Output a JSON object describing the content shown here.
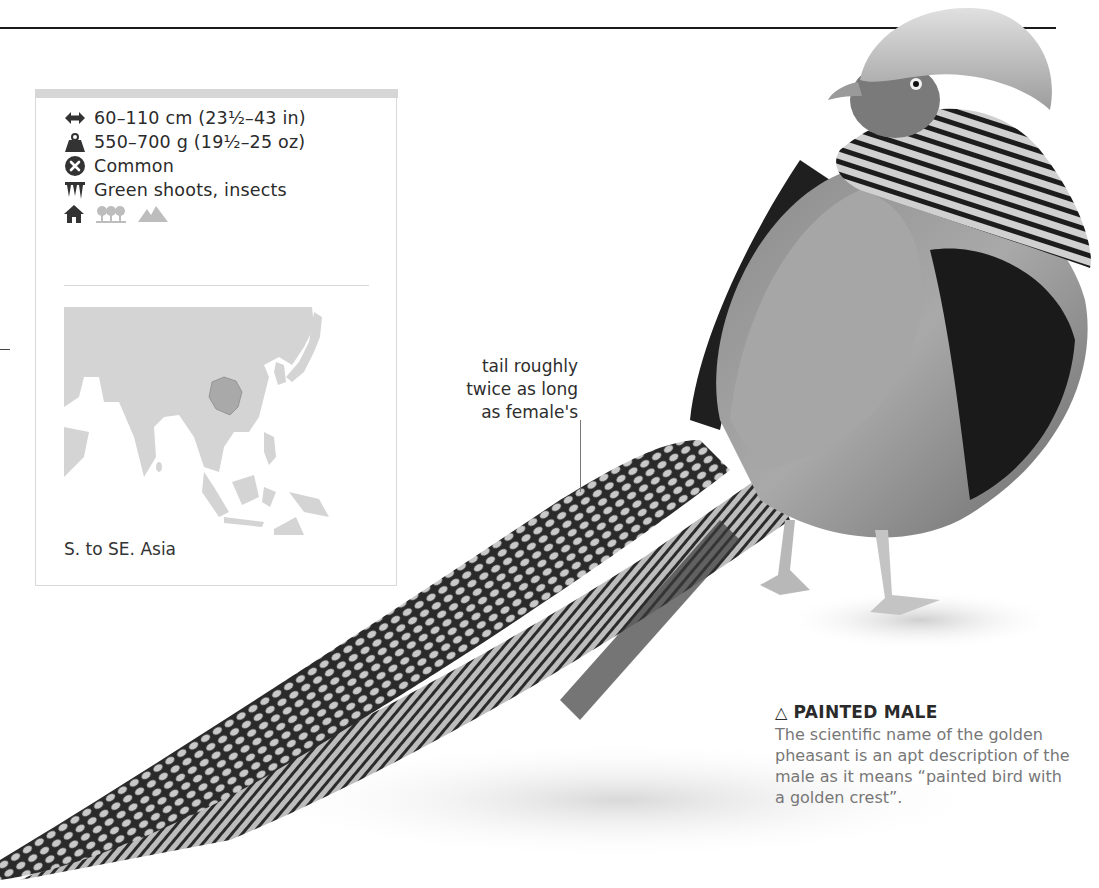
{
  "page": {
    "top_rule": true
  },
  "info_box": {
    "facts": [
      {
        "icon": "length-arrows-icon",
        "text": "60–110 cm (23½–43 in)"
      },
      {
        "icon": "weight-icon",
        "text": "550–700 g (19½–25 oz)"
      },
      {
        "icon": "status-x-icon",
        "text": "Common"
      },
      {
        "icon": "diet-icon",
        "text": "Green shoots, insects"
      }
    ],
    "habitats": [
      {
        "icon": "house-icon",
        "active": true
      },
      {
        "icon": "woodland-trees-icon",
        "active": false
      },
      {
        "icon": "mountains-icon",
        "active": false
      }
    ],
    "range_label": "S. to SE. Asia",
    "colors": {
      "land": "#d4d4d4",
      "range": "#a9a9a9",
      "bar": "#d6d6d6"
    }
  },
  "annotation": {
    "lines": [
      "tail roughly",
      "twice as long",
      "as female's"
    ]
  },
  "caption": {
    "marker": "△",
    "title": "PAINTED MALE",
    "body": "The scientific name of the golden pheasant is an apt description of the male as it means “painted bird with a golden crest”."
  }
}
